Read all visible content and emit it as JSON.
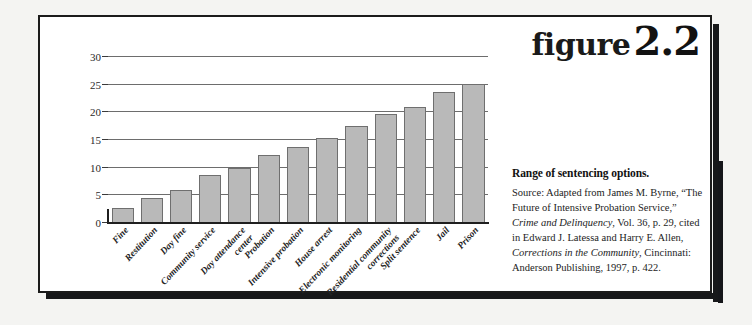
{
  "figure": {
    "word": "figure",
    "number": "2.2"
  },
  "caption": {
    "title": "Range of sentencing options.",
    "source_segments": [
      {
        "text": "Source: Adapted from James M. Byrne, “The Future of Intensive Probation Service,” ",
        "italic": false
      },
      {
        "text": "Crime and Delinquency",
        "italic": true
      },
      {
        "text": ", Vol. 36, p. 29, cited in Edward J. Latessa and Harry E. Allen, ",
        "italic": false
      },
      {
        "text": "Corrections in the Community",
        "italic": true
      },
      {
        "text": ", Cincinnati: Anderson Publishing, 1997, p. 422.",
        "italic": false
      }
    ],
    "source_plain": "Source: Adapted from James M. Byrne, “The Future of Intensive Probation Service,” Crime and Delinquency, Vol. 36, p. 29, cited in Edward J. Latessa and Harry E. Allen, Corrections in the Community, Cincinnati: Anderson Publishing, 1997, p. 422."
  },
  "colors": {
    "bar_fill": "#b9b9b9",
    "bar_stroke": "#6f6f6f",
    "gridline": "#6d6d6d",
    "axis": "#1f1f1f",
    "frame": "#1b1b1b",
    "shadow": "#17181a",
    "text": "#1c1c1c"
  },
  "chart_data": {
    "type": "bar",
    "title": "Range of sentencing options.",
    "xlabel": "",
    "ylabel": "",
    "ylim": [
      0,
      30
    ],
    "yticks": [
      0,
      5,
      10,
      15,
      20,
      25,
      30
    ],
    "ytick_labels": [
      "0",
      "5",
      "10",
      "15",
      "20",
      "25",
      "30"
    ],
    "grid": true,
    "legend": false,
    "orientation": "vertical",
    "categories": [
      "Fine",
      "Restitution",
      "Day fine",
      "Community service",
      "Day attendance center",
      "Probation",
      "Intensive probation",
      "House arrest",
      "Electronic monitoring",
      "Residential community corrections",
      "Split sentence",
      "Jail",
      "Prison"
    ],
    "category_lines": [
      [
        "Fine"
      ],
      [
        "Restitution"
      ],
      [
        "Day fine"
      ],
      [
        "Community service"
      ],
      [
        "Day attendance",
        "center"
      ],
      [
        "Probation"
      ],
      [
        "Intensive probation"
      ],
      [
        "House arrest"
      ],
      [
        "Electronic monitoring"
      ],
      [
        "Residential community",
        "corrections"
      ],
      [
        "Split sentence"
      ],
      [
        "Jail"
      ],
      [
        "Prison"
      ]
    ],
    "values": [
      2.8,
      4.6,
      6.0,
      8.7,
      9.9,
      12.3,
      13.8,
      15.3,
      17.6,
      19.7,
      20.9,
      23.6,
      25.1
    ]
  }
}
